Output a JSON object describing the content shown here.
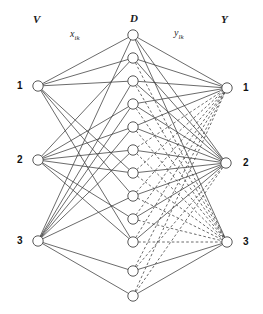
{
  "figure": {
    "type": "neural-network-diagram",
    "width": 263,
    "height": 314,
    "background_color": "#ffffff",
    "line_color": "#3a3a3a",
    "node_fill": "#ffffff",
    "node_stroke": "#3a3a3a"
  },
  "column_labels": {
    "input": "V",
    "hidden": "D",
    "output": "Y"
  },
  "edge_labels": {
    "input_to_hidden": {
      "base": "x",
      "subscript": "ik"
    },
    "hidden_to_output": {
      "base": "y",
      "subscript": "lk"
    }
  },
  "layers": {
    "input": {
      "name": "V",
      "node_labels": [
        "1",
        "2",
        "3"
      ],
      "nodes": [
        {
          "label": "1",
          "cx": 38,
          "cy": 86
        },
        {
          "label": "2",
          "cx": 38,
          "cy": 160
        },
        {
          "label": "3",
          "cx": 38,
          "cy": 241
        }
      ]
    },
    "hidden": {
      "name": "D",
      "node_count": 12,
      "nodes": [
        {
          "cx": 133,
          "cy": 35
        },
        {
          "cx": 133,
          "cy": 58
        },
        {
          "cx": 133,
          "cy": 81
        },
        {
          "cx": 133,
          "cy": 104
        },
        {
          "cx": 133,
          "cy": 127
        },
        {
          "cx": 133,
          "cy": 150
        },
        {
          "cx": 133,
          "cy": 173
        },
        {
          "cx": 133,
          "cy": 196
        },
        {
          "cx": 133,
          "cy": 219
        },
        {
          "cx": 133,
          "cy": 242
        },
        {
          "cx": 133,
          "cy": 271
        },
        {
          "cx": 133,
          "cy": 296
        }
      ]
    },
    "output": {
      "name": "Y",
      "node_labels": [
        "1",
        "2",
        "3"
      ],
      "nodes": [
        {
          "label": "1",
          "cx": 227,
          "cy": 88
        },
        {
          "label": "2",
          "cx": 226,
          "cy": 163
        },
        {
          "label": "3",
          "cx": 227,
          "cy": 242
        }
      ]
    }
  },
  "label_positions": {
    "input_title": {
      "x": 33,
      "y": 14
    },
    "hidden_title": {
      "x": 130,
      "y": 13
    },
    "output_title": {
      "x": 221,
      "y": 14
    },
    "x_label": {
      "x": 70,
      "y": 29
    },
    "y_label": {
      "x": 174,
      "y": 28
    },
    "input_num_x": 17,
    "output_num_x": 243
  },
  "edges": {
    "input_to_hidden_style": "solid",
    "hidden_to_output_solid_style": "solid",
    "hidden_to_output_dashed_style": "dashed",
    "input_to_hidden": [
      {
        "from": 0,
        "to": 0
      },
      {
        "from": 0,
        "to": 1
      },
      {
        "from": 0,
        "to": 2
      },
      {
        "from": 0,
        "to": 6
      },
      {
        "from": 0,
        "to": 7
      },
      {
        "from": 0,
        "to": 9
      },
      {
        "from": 1,
        "to": 1
      },
      {
        "from": 1,
        "to": 3
      },
      {
        "from": 1,
        "to": 4
      },
      {
        "from": 1,
        "to": 5
      },
      {
        "from": 1,
        "to": 6
      },
      {
        "from": 1,
        "to": 8
      },
      {
        "from": 1,
        "to": 9
      },
      {
        "from": 2,
        "to": 0
      },
      {
        "from": 2,
        "to": 2
      },
      {
        "from": 2,
        "to": 3
      },
      {
        "from": 2,
        "to": 4
      },
      {
        "from": 2,
        "to": 5
      },
      {
        "from": 2,
        "to": 7
      },
      {
        "from": 2,
        "to": 10
      },
      {
        "from": 2,
        "to": 11
      }
    ],
    "hidden_to_output": [
      {
        "from": 0,
        "to": 0,
        "style": "solid"
      },
      {
        "from": 0,
        "to": 1,
        "style": "solid"
      },
      {
        "from": 0,
        "to": 2,
        "style": "solid"
      },
      {
        "from": 1,
        "to": 0,
        "style": "solid"
      },
      {
        "from": 1,
        "to": 1,
        "style": "solid"
      },
      {
        "from": 1,
        "to": 2,
        "style": "dashed"
      },
      {
        "from": 2,
        "to": 0,
        "style": "solid"
      },
      {
        "from": 2,
        "to": 1,
        "style": "solid"
      },
      {
        "from": 2,
        "to": 2,
        "style": "dashed"
      },
      {
        "from": 3,
        "to": 0,
        "style": "solid"
      },
      {
        "from": 3,
        "to": 1,
        "style": "solid"
      },
      {
        "from": 3,
        "to": 2,
        "style": "dashed"
      },
      {
        "from": 4,
        "to": 0,
        "style": "solid"
      },
      {
        "from": 4,
        "to": 1,
        "style": "solid"
      },
      {
        "from": 4,
        "to": 2,
        "style": "dashed"
      },
      {
        "from": 5,
        "to": 0,
        "style": "dashed"
      },
      {
        "from": 5,
        "to": 1,
        "style": "solid"
      },
      {
        "from": 5,
        "to": 2,
        "style": "dashed"
      },
      {
        "from": 6,
        "to": 0,
        "style": "dashed"
      },
      {
        "from": 6,
        "to": 1,
        "style": "solid"
      },
      {
        "from": 6,
        "to": 2,
        "style": "dashed"
      },
      {
        "from": 7,
        "to": 0,
        "style": "dashed"
      },
      {
        "from": 7,
        "to": 1,
        "style": "solid"
      },
      {
        "from": 7,
        "to": 2,
        "style": "dashed"
      },
      {
        "from": 8,
        "to": 0,
        "style": "dashed"
      },
      {
        "from": 8,
        "to": 1,
        "style": "solid"
      },
      {
        "from": 8,
        "to": 2,
        "style": "dashed"
      },
      {
        "from": 9,
        "to": 0,
        "style": "dashed"
      },
      {
        "from": 9,
        "to": 1,
        "style": "solid"
      },
      {
        "from": 9,
        "to": 2,
        "style": "dashed"
      },
      {
        "from": 10,
        "to": 0,
        "style": "dashed"
      },
      {
        "from": 10,
        "to": 1,
        "style": "dashed"
      },
      {
        "from": 10,
        "to": 2,
        "style": "solid"
      },
      {
        "from": 11,
        "to": 0,
        "style": "dashed"
      },
      {
        "from": 11,
        "to": 1,
        "style": "dashed"
      },
      {
        "from": 11,
        "to": 2,
        "style": "solid"
      }
    ]
  }
}
